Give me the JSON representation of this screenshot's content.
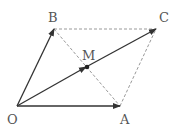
{
  "diagram": {
    "type": "vector-parallelogram",
    "points": {
      "O": {
        "label": "O"
      },
      "A": {
        "label": "A"
      },
      "B": {
        "label": "B"
      },
      "C": {
        "label": "C"
      },
      "M": {
        "label": "M"
      }
    },
    "vectors": [
      {
        "from": "O",
        "to": "A",
        "style": "solid-arrow"
      },
      {
        "from": "O",
        "to": "B",
        "style": "solid-arrow"
      },
      {
        "from": "O",
        "to": "C",
        "style": "solid-arrow",
        "midpoint_arrow_at": "M"
      }
    ],
    "dashed_segments": [
      {
        "from": "B",
        "to": "C"
      },
      {
        "from": "A",
        "to": "C"
      },
      {
        "from": "B",
        "to": "A"
      }
    ],
    "colors": {
      "solid": "#333333",
      "dashed": "#999999",
      "label": "#555555"
    }
  }
}
